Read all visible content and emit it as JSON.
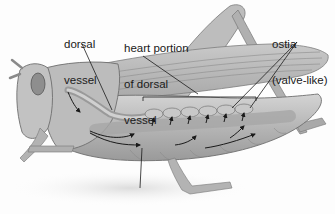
{
  "diagram": {
    "labels": {
      "dorsal_vessel": {
        "line1": "dorsal",
        "line2": "vessel"
      },
      "heart_portion": {
        "line1": "heart portion",
        "line2": "of dorsal",
        "line3": "vessel"
      },
      "ostia": {
        "line1": "ostia",
        "line2": "(valve-like)"
      },
      "hemocoel": {
        "line1": "hemocoel"
      }
    },
    "colors": {
      "body_fill": "#b9b9b9",
      "body_shade": "#8f8f8f",
      "body_light": "#d6d6d6",
      "outline": "#6e6e6e",
      "leader_line": "#1a1a1a",
      "arrow": "#1a1a1a",
      "background": "#fdfdfd"
    }
  }
}
